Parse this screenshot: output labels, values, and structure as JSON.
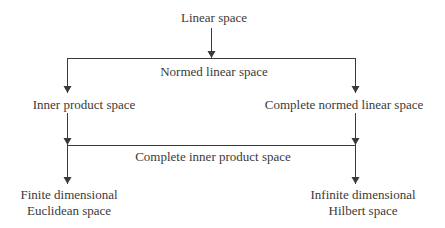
{
  "diagram": {
    "colors": {
      "line": "#3a3a3a",
      "text": "#3a3a3a",
      "background": "#ffffff"
    },
    "nodes": {
      "linear_space": "Linear space",
      "normed_linear_space": "Normed linear space",
      "inner_product_space": "Inner product space",
      "complete_normed_linear_space": "Complete normed linear space",
      "complete_inner_product_space": "Complete inner product space",
      "finite_dimensional_line1": "Finite dimensional",
      "finite_dimensional_line2": "Euclidean space",
      "infinite_dimensional_line1": "Infinite dimensional",
      "infinite_dimensional_line2": "Hilbert space"
    },
    "edges": [
      {
        "from": "Linear space",
        "to": "Normed linear space"
      },
      {
        "from": "Normed linear space",
        "to": "Inner product space"
      },
      {
        "from": "Normed linear space",
        "to": "Complete normed linear space"
      },
      {
        "from": "Inner product space",
        "to": "Complete inner product space"
      },
      {
        "from": "Complete normed linear space",
        "to": "Complete inner product space"
      },
      {
        "from": "Complete inner product space",
        "to": "Finite dimensional Euclidean space"
      },
      {
        "from": "Complete inner product space",
        "to": "Infinite dimensional Hilbert space"
      }
    ]
  }
}
